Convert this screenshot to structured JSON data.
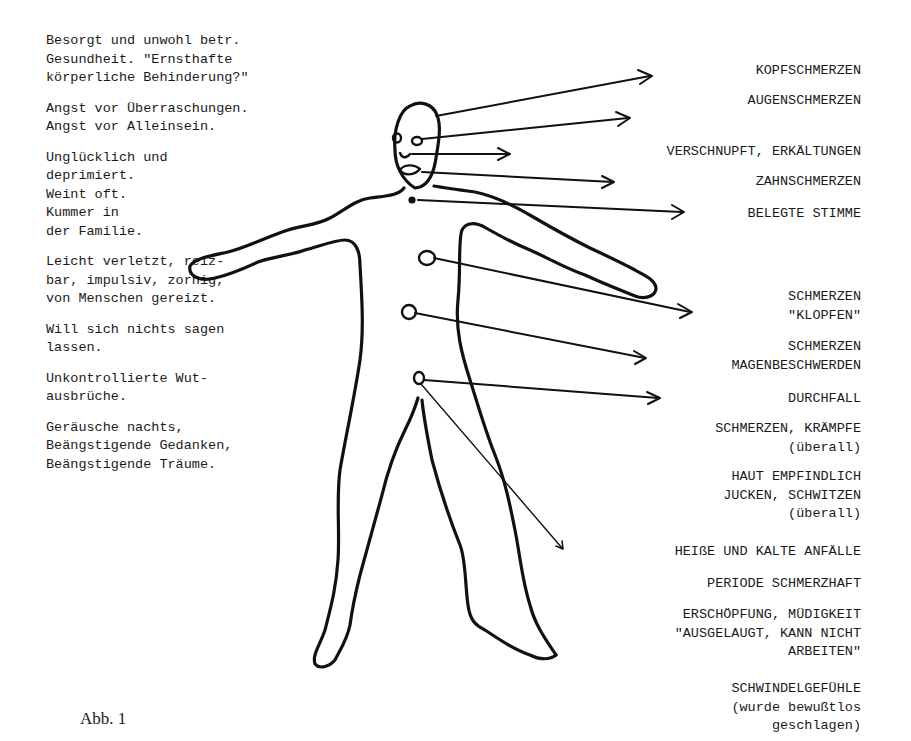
{
  "left_text": [
    {
      "lines": [
        "Besorgt und unwohl betr.",
        "Gesundheit. \"Ernsthafte",
        "körperliche Behinderung?\""
      ]
    },
    {
      "lines": [
        "Angst vor Überraschungen.",
        "Angst vor Alleinsein."
      ]
    },
    {
      "lines": [
        "Unglücklich und",
        "deprimiert.",
        "Weint oft.",
        "Kummer in",
        "der Familie."
      ]
    },
    {
      "lines": [
        "Leicht verletzt, reiz-",
        "bar, impulsiv, zornig,",
        "von Menschen gereizt."
      ]
    },
    {
      "lines": [
        "Will sich nichts sagen",
        "lassen."
      ]
    },
    {
      "lines": [
        "Unkontrollierte Wut-",
        "ausbrüche."
      ]
    },
    {
      "lines": [
        "Geräusche nachts,",
        "Beängstigende Gedanken,",
        "Beängstigende Träume."
      ]
    }
  ],
  "right_labels": [
    {
      "text": "KOPFSCHMERZEN",
      "top": 62
    },
    {
      "text": "AUGENSCHMERZEN",
      "top": 92
    },
    {
      "text": "VERSCHNUPFT, ERKÄLTUNGEN",
      "top": 143
    },
    {
      "text": "ZAHNSCHMERZEN",
      "top": 173
    },
    {
      "text": "BELEGTE STIMME",
      "top": 205
    },
    {
      "text": "SCHMERZEN\n\"KLOPFEN\"",
      "top": 288
    },
    {
      "text": "SCHMERZEN\nMAGENBESCHWERDEN",
      "top": 338
    },
    {
      "text": "DURCHFALL",
      "top": 390
    },
    {
      "text": "SCHMERZEN, KRÄMPFE\n(überall)",
      "top": 420
    },
    {
      "text": "HAUT EMPFINDLICH\nJUCKEN, SCHWITZEN\n(überall)",
      "top": 468
    },
    {
      "text": "HEIßE UND KALTE ANFÄLLE",
      "top": 543
    },
    {
      "text": "PERIODE SCHMERZHAFT",
      "top": 575
    },
    {
      "text": "ERSCHÖPFUNG, MÜDIGKEIT\n\"AUSGELAUGT, KANN NICHT\nARBEITEN\"",
      "top": 606
    },
    {
      "text": "SCHWINDELGEFÜHLE\n(wurde bewußtlos\ngeschlagen)",
      "top": 680
    }
  ],
  "caption": "Abb. 1",
  "figure": {
    "stroke_color": "#111111"
  }
}
